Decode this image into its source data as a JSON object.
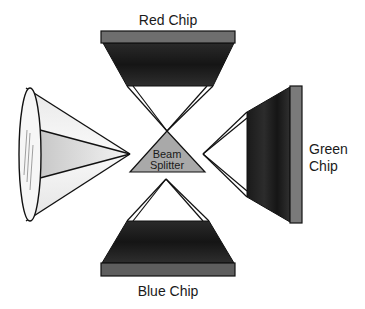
{
  "diagram": {
    "type": "three-chip-projection",
    "labels": {
      "red_chip": "Red Chip",
      "green_chip_line1": "Green",
      "green_chip_line2": "Chip",
      "blue_chip": "Blue Chip",
      "beam_splitter_line1": "Beam",
      "beam_splitter_line2": "Splitter"
    },
    "components": [
      {
        "id": "lens",
        "name": "Projection lens cone",
        "position": "left"
      },
      {
        "id": "red-chip",
        "name": "Red Chip",
        "position": "top"
      },
      {
        "id": "green-chip",
        "name": "Green Chip",
        "position": "right"
      },
      {
        "id": "blue-chip",
        "name": "Blue Chip",
        "position": "bottom"
      },
      {
        "id": "beam-splitter",
        "name": "Beam Splitter",
        "position": "center"
      }
    ],
    "colors": {
      "chip_dark": "#1e1e1e",
      "chip_bar": "#6e6e6e",
      "beam_splitter_fill": "#a9a9a9",
      "lens_light": "#f2f2f2",
      "lens_shade": "#cfcfcf",
      "stroke": "#111111"
    }
  }
}
